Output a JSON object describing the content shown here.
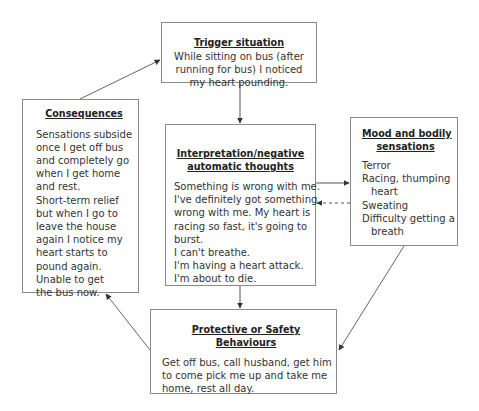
{
  "diagram": {
    "type": "cbt-panic-cycle",
    "boxes": {
      "trigger": {
        "title": "Trigger situation",
        "lines": [
          "While sitting on bus (after",
          "running for bus) I noticed",
          "my heart pounding."
        ]
      },
      "consequences": {
        "title": "Consequences",
        "lines": [
          "Sensations subside",
          "once I get off bus",
          "and completely go",
          "when I get home",
          "and rest.",
          "Short-term relief",
          "but when I go to",
          "leave the house",
          "again I notice my",
          "heart starts to",
          "pound again.",
          "Unable to get",
          "the bus now."
        ]
      },
      "interpretation": {
        "title_lines": [
          "Interpretation/negative",
          "automatic thoughts"
        ],
        "lines": [
          "Something is wrong with me.",
          "I've definitely got something",
          "wrong with me. My heart is",
          "racing so fast, it's going to",
          "burst.",
          "I can't breathe.",
          "I'm having a heart attack.",
          "I'm about to die."
        ]
      },
      "mood": {
        "title_lines": [
          "Mood and bodily",
          "sensations"
        ],
        "lines": [
          "Terror",
          "Racing, thumping",
          "heart",
          "Sweating",
          "Difficulty getting a",
          "breath"
        ]
      },
      "protective": {
        "title": "Protective or Safety Behaviours",
        "lines": [
          "Get off bus, call husband, get him",
          "to come pick me up and take me",
          "home, rest all day."
        ]
      }
    },
    "connections": [
      {
        "from": "trigger",
        "to": "interpretation",
        "style": "solid"
      },
      {
        "from": "interpretation",
        "to": "mood",
        "style": "solid"
      },
      {
        "from": "mood",
        "to": "interpretation",
        "style": "dashed"
      },
      {
        "from": "interpretation",
        "to": "protective",
        "style": "solid"
      },
      {
        "from": "mood",
        "to": "protective",
        "style": "solid"
      },
      {
        "from": "protective",
        "to": "consequences",
        "style": "solid"
      },
      {
        "from": "consequences",
        "to": "trigger",
        "style": "solid"
      }
    ],
    "colors": {
      "border": "#8a8a8a",
      "line": "#555555",
      "text": "#333333",
      "background": "#ffffff"
    }
  }
}
